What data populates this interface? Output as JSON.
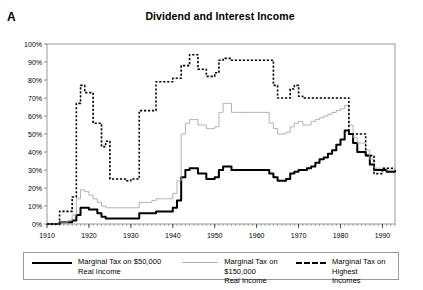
{
  "panel_label": "A",
  "title": "Dividend and Interest Income",
  "legend": {
    "items": [
      {
        "label_line1": "Marginal Tax on $50,000",
        "label_line2": "Real Income",
        "style": "solid-thick",
        "color": "#000000"
      },
      {
        "label_line1": "Marginal Tax on $150,000",
        "label_line2": "Real Income",
        "style": "solid-thin",
        "color": "#b0b0b0"
      },
      {
        "label_line1": "Marginal Tax on Highest",
        "label_line2": "Incomes",
        "style": "dashed",
        "color": "#000000"
      }
    ]
  },
  "chart_data": {
    "type": "line",
    "title": "Dividend and Interest Income",
    "xlabel": "",
    "ylabel": "",
    "xlim": [
      1910,
      1993
    ],
    "ylim": [
      0,
      100
    ],
    "xticks": [
      1910,
      1920,
      1930,
      1940,
      1950,
      1960,
      1970,
      1980,
      1990
    ],
    "xtick_labels": [
      "1910",
      "1920",
      "1930",
      "1940",
      "1950",
      "1960",
      "1970",
      "1980",
      "1990"
    ],
    "yticks": [
      0,
      10,
      20,
      30,
      40,
      50,
      60,
      70,
      80,
      90,
      100
    ],
    "ytick_labels": [
      "0%",
      "10%",
      "20%",
      "30%",
      "40%",
      "50%",
      "60%",
      "70%",
      "80%",
      "90%",
      "100%"
    ],
    "grid": false,
    "legend_position": "below",
    "x": [
      1910,
      1911,
      1912,
      1913,
      1914,
      1915,
      1916,
      1917,
      1918,
      1919,
      1920,
      1921,
      1922,
      1923,
      1924,
      1925,
      1926,
      1927,
      1928,
      1929,
      1930,
      1931,
      1932,
      1933,
      1934,
      1935,
      1936,
      1937,
      1938,
      1939,
      1940,
      1941,
      1942,
      1943,
      1944,
      1945,
      1946,
      1947,
      1948,
      1949,
      1950,
      1951,
      1952,
      1953,
      1954,
      1955,
      1956,
      1957,
      1958,
      1959,
      1960,
      1961,
      1962,
      1963,
      1964,
      1965,
      1966,
      1967,
      1968,
      1969,
      1970,
      1971,
      1972,
      1973,
      1974,
      1975,
      1976,
      1977,
      1978,
      1979,
      1980,
      1981,
      1982,
      1983,
      1984,
      1985,
      1986,
      1987,
      1988,
      1989,
      1990,
      1991,
      1992,
      1993
    ],
    "series": [
      {
        "name": "Marginal Tax on $50,000 Real Income",
        "style": "solid-thick",
        "color": "#000000",
        "values": [
          0,
          0,
          0,
          1,
          1,
          1,
          2,
          5,
          9,
          9,
          8,
          8,
          6,
          4,
          3,
          3,
          3,
          3,
          3,
          3,
          3,
          3,
          6,
          6,
          6,
          6,
          7,
          7,
          7,
          7,
          9,
          13,
          26,
          30,
          31,
          31,
          28,
          28,
          25,
          25,
          26,
          30,
          32,
          32,
          30,
          30,
          30,
          30,
          30,
          30,
          30,
          30,
          30,
          28,
          26,
          24,
          24,
          25,
          28,
          29,
          30,
          30,
          31,
          32,
          34,
          36,
          37,
          39,
          41,
          44,
          47,
          52,
          50,
          45,
          40,
          40,
          38,
          33,
          30,
          30,
          30,
          29,
          29,
          30
        ]
      },
      {
        "name": "Marginal Tax on $150,000 Real Income",
        "style": "solid-thin",
        "color": "#aaaaaa",
        "values": [
          0,
          0,
          0,
          1,
          1,
          2,
          5,
          14,
          19,
          18,
          16,
          14,
          12,
          10,
          9,
          9,
          9,
          9,
          9,
          9,
          9,
          9,
          12,
          12,
          12,
          13,
          14,
          14,
          14,
          14,
          17,
          24,
          50,
          56,
          58,
          58,
          55,
          55,
          53,
          53,
          54,
          62,
          67,
          67,
          62,
          62,
          62,
          62,
          62,
          62,
          62,
          62,
          62,
          56,
          53,
          50,
          50,
          51,
          54,
          56,
          57,
          55,
          55,
          57,
          58,
          59,
          60,
          61,
          62,
          63,
          64,
          66,
          55,
          48,
          45,
          45,
          41,
          36,
          31,
          31,
          31,
          30,
          30,
          31
        ]
      },
      {
        "name": "Marginal Tax on Highest Incomes",
        "style": "dashed",
        "color": "#000000",
        "values": [
          0,
          0,
          0,
          7,
          7,
          7,
          15,
          67,
          77,
          73,
          73,
          56,
          56,
          43,
          46,
          25,
          25,
          25,
          25,
          24,
          25,
          25,
          63,
          63,
          63,
          63,
          79,
          79,
          79,
          79,
          81,
          81,
          88,
          88,
          94,
          94,
          86,
          86,
          82,
          82,
          84,
          91,
          92,
          92,
          91,
          91,
          91,
          91,
          91,
          91,
          91,
          91,
          91,
          91,
          77,
          70,
          70,
          70,
          75,
          77,
          71,
          70,
          70,
          70,
          70,
          70,
          70,
          70,
          70,
          70,
          70,
          70,
          50,
          50,
          50,
          50,
          38,
          38,
          28,
          28,
          31,
          31,
          31,
          31
        ]
      }
    ]
  }
}
